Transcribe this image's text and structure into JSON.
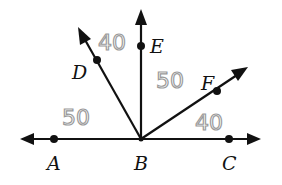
{
  "diagram": {
    "type": "angle-figure",
    "vertex": "B",
    "points": [
      {
        "name": "A",
        "label": "A"
      },
      {
        "name": "B",
        "label": "B"
      },
      {
        "name": "C",
        "label": "C"
      },
      {
        "name": "D",
        "label": "D"
      },
      {
        "name": "E",
        "label": "E"
      },
      {
        "name": "F",
        "label": "F"
      }
    ],
    "rays": [
      "BA",
      "BC",
      "BD",
      "BE",
      "BF"
    ],
    "handwritten_angle_labels": [
      {
        "angle": "ABD",
        "value": "50"
      },
      {
        "angle": "DBE",
        "value": "40"
      },
      {
        "angle": "EBF",
        "value": "50"
      },
      {
        "angle": "FBC",
        "value": "40"
      }
    ]
  },
  "colors": {
    "line": "#111111",
    "handwriting": "#9a9a9a",
    "background": "#ffffff"
  }
}
